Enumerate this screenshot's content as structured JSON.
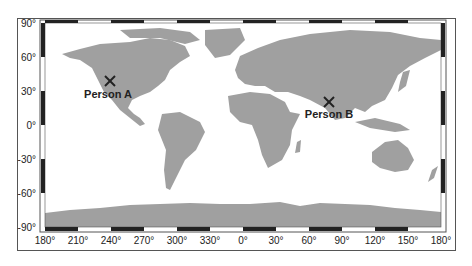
{
  "map": {
    "projection": "equirectangular",
    "land_color": "#a0a0a0",
    "frame_colors": [
      "#222222",
      "#ffffff"
    ],
    "x_ticks": [
      "180°",
      "210°",
      "240°",
      "270°",
      "300°",
      "330°",
      "0°",
      "30°",
      "60°",
      "90°",
      "120°",
      "150°",
      "180°"
    ],
    "y_ticks": [
      "90°",
      "60°",
      "30°",
      "0°",
      "-30°",
      "-60°",
      "-90°"
    ],
    "markers": [
      {
        "label": "Person A",
        "lon": -120,
        "lat": 38,
        "symbol": "×"
      },
      {
        "label": "Person B",
        "lon": 77,
        "lat": 21,
        "symbol": "×"
      }
    ]
  }
}
